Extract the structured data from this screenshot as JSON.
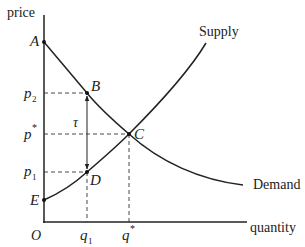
{
  "diagram": {
    "axes": {
      "y_label": "price",
      "x_label": "quantity",
      "origin_label": "O"
    },
    "curves": {
      "supply_label": "Supply",
      "demand_label": "Demand"
    },
    "points": {
      "A": "A",
      "B": "B",
      "C": "C",
      "D": "D",
      "E": "E"
    },
    "price_ticks": {
      "p2_base": "p",
      "p2_sub": "2",
      "pstar_base": "p",
      "pstar_sup": "*",
      "p1_base": "p",
      "p1_sub": "1"
    },
    "quantity_ticks": {
      "q1_base": "q",
      "q1_sub": "1",
      "qstar_base": "q",
      "qstar_sup": "*"
    },
    "tax_label": "τ",
    "colors": {
      "line": "#222222",
      "text": "#222222"
    }
  }
}
